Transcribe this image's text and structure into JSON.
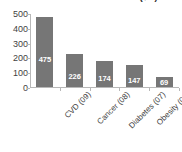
{
  "chart_data": {
    "type": "bar",
    "title": "Cost of Disease in the US ($B)",
    "xlabel": "",
    "ylabel": "",
    "categories": [
      "CVD (09)",
      "Cancer (08)",
      "Diabetes (07)",
      "Obesity (08)",
      "Stroke (09)"
    ],
    "values": [
      475,
      226,
      174,
      147,
      69
    ],
    "value_labels": [
      "475",
      "226",
      "174",
      "147",
      "69"
    ],
    "ylim": [
      0,
      500
    ],
    "yticks": [
      0,
      100,
      200,
      300,
      400,
      500
    ],
    "ytick_labels": [
      "0",
      "100",
      "200",
      "300",
      "400",
      "500"
    ],
    "grid": false,
    "legend": false,
    "bar_color": "#767676",
    "value_label_color": "#ffffff",
    "axis_color": "#b8b8b8",
    "text_color": "#3f3f3f",
    "background": "#ffffff"
  }
}
